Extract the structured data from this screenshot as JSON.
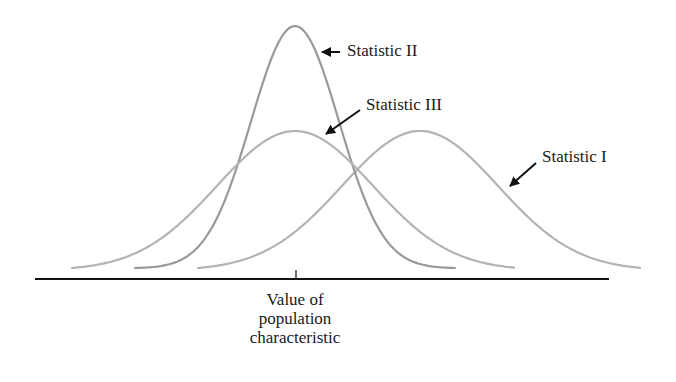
{
  "chart_data": {
    "type": "line",
    "title": "",
    "xlabel": "Value of population characteristic",
    "ylabel": "",
    "grid": false,
    "legend": "annotations with arrows",
    "series": [
      {
        "name": "Statistic I",
        "center_px": 420,
        "peak_y_px": 131,
        "sigma_px": 78,
        "x_start_px": 198,
        "x_end_px": 641,
        "color": "#b3b3b3",
        "description": "biased (center right of true value), wide spread"
      },
      {
        "name": "Statistic II",
        "center_px": 295,
        "peak_y_px": 26,
        "sigma_px": 44,
        "x_start_px": 135,
        "x_end_px": 455,
        "color": "#999999",
        "description": "unbiased, small spread"
      },
      {
        "name": "Statistic III",
        "center_px": 295,
        "peak_y_px": 131,
        "sigma_px": 78,
        "x_start_px": 72,
        "x_end_px": 515,
        "color": "#b3b3b3",
        "description": "unbiased, wide spread"
      }
    ],
    "axis": {
      "y_px": 279,
      "x_start_px": 35,
      "x_end_px": 609,
      "tick_x_px": 296
    }
  },
  "labels": {
    "stat1": "Statistic I",
    "stat2": "Statistic II",
    "stat3": "Statistic III",
    "xcaption_line1": "Value of",
    "xcaption_line2": "population",
    "xcaption_line3": "characteristic"
  }
}
